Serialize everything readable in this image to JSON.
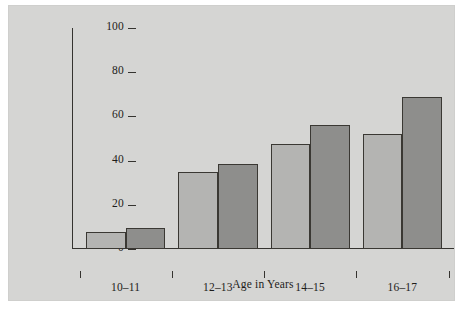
{
  "chart_data": {
    "type": "bar",
    "title": "",
    "xlabel": "Age in Years",
    "ylabel": "Adolescents Who Tried Smoking (%)",
    "categories": [
      "10–11",
      "12–13",
      "14–15",
      "16–17"
    ],
    "series": [
      {
        "name": "series-1",
        "color": "#b4b4b2",
        "values": [
          7.5,
          35,
          47.5,
          52
        ]
      },
      {
        "name": "series-2",
        "color": "#8e8e8c",
        "values": [
          9.5,
          38.5,
          56,
          69
        ]
      }
    ],
    "ylim": [
      0,
      100
    ],
    "ytick_labels": [
      "0",
      "20",
      "40",
      "60",
      "80",
      "100"
    ],
    "ytick_values": [
      0,
      20,
      40,
      60,
      80,
      100
    ],
    "grid": false,
    "legend": "none"
  }
}
